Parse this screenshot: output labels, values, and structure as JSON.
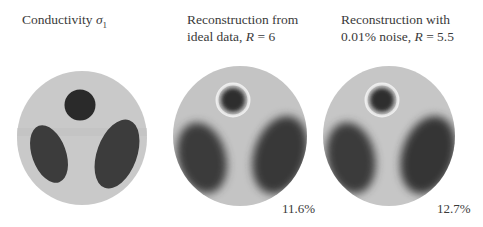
{
  "figure": {
    "panels": [
      {
        "id": "ground-truth",
        "caption_line1": "Conductivity ",
        "caption_symbol": "σ",
        "caption_sub": "1",
        "error_label": null
      },
      {
        "id": "ideal-reconstruction",
        "caption_line1": "Reconstruction from",
        "caption_line2_prefix": "ideal data, ",
        "caption_var": "R",
        "caption_eq": " = 6",
        "error_label": "11.6%"
      },
      {
        "id": "noisy-reconstruction",
        "caption_line1": "Reconstruction with",
        "caption_line2_prefix": "0.01% noise, ",
        "caption_var": "R",
        "caption_eq": " = 5.5",
        "error_label": "12.7%"
      }
    ],
    "colors": {
      "background_disk": "#c9c9c9",
      "inclusion": "#3a3a3a",
      "inclusion_small": "#2a2a2a",
      "ring_highlight": "#f2f2f2"
    }
  }
}
